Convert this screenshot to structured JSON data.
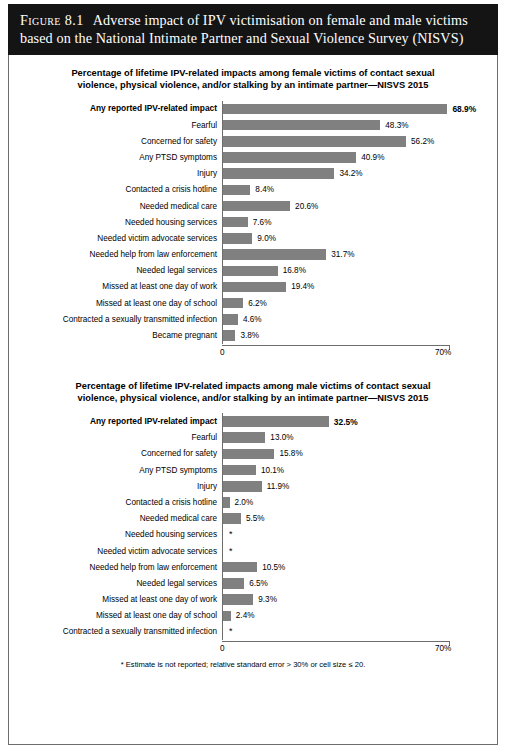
{
  "figure": {
    "label": "Figure 8.1",
    "title_line1": "Adverse impact of IPV victimisation on female and male victims",
    "title_line2": "based on the National Intimate Partner and Sexual Violence Survey (NISVS)"
  },
  "footnote": "* Estimate is not reported; relative standard error > 30% or cell size ≤ 20.",
  "axis": {
    "min_label": "0",
    "max_label": "70%"
  },
  "colors": {
    "bar": "#808080",
    "banner": "#141414",
    "frame": "#6d6d6d",
    "text": "#000000"
  },
  "chart_data": [
    {
      "type": "bar",
      "orientation": "horizontal",
      "title": "Percentage of lifetime IPV-related impacts among female victims of contact sexual violence, physical violence, and/or stalking by an intimate partner—NISVS 2015",
      "title_line1": "Percentage of lifetime IPV-related impacts among female victims of contact sexual",
      "title_line2": "violence, physical violence, and/or stalking by an intimate partner—NISVS 2015",
      "xlabel": "",
      "ylabel": "",
      "xlim": [
        0,
        70
      ],
      "grid": false,
      "legend": "none",
      "categories": [
        "Any reported IPV-related impact",
        "Fearful",
        "Concerned for safety",
        "Any PTSD symptoms",
        "Injury",
        "Contacted a crisis hotline",
        "Needed medical care",
        "Needed housing services",
        "Needed victim advocate services",
        "Needed help from law enforcement",
        "Needed legal services",
        "Missed at least one day of work",
        "Missed at least one day of school",
        "Contracted a sexually transmitted infection",
        "Became pregnant"
      ],
      "values": [
        68.9,
        48.3,
        56.2,
        40.9,
        34.2,
        8.4,
        20.6,
        7.6,
        9.0,
        31.7,
        16.8,
        19.4,
        6.2,
        4.6,
        3.8
      ],
      "value_labels": [
        "68.9%",
        "48.3%",
        "56.2%",
        "40.9%",
        "34.2%",
        "8.4%",
        "20.6%",
        "7.6%",
        "9.0%",
        "31.7%",
        "16.8%",
        "19.4%",
        "6.2%",
        "4.6%",
        "3.8%"
      ],
      "emphasis": [
        true,
        false,
        false,
        false,
        false,
        false,
        false,
        false,
        false,
        false,
        false,
        false,
        false,
        false,
        false
      ]
    },
    {
      "type": "bar",
      "orientation": "horizontal",
      "title": "Percentage of lifetime IPV-related impacts among male victims of contact sexual violence, physical violence, and/or stalking by an intimate partner—NISVS 2015",
      "title_line1": "Percentage of lifetime IPV-related impacts among male victims of contact sexual",
      "title_line2": "violence, physical violence, and/or stalking by an intimate partner—NISVS 2015",
      "xlabel": "",
      "ylabel": "",
      "xlim": [
        0,
        70
      ],
      "grid": false,
      "legend": "none",
      "categories": [
        "Any reported IPV-related impact",
        "Fearful",
        "Concerned for safety",
        "Any PTSD symptoms",
        "Injury",
        "Contacted a crisis hotline",
        "Needed medical care",
        "Needed housing services",
        "Needed victim advocate services",
        "Needed help from law enforcement",
        "Needed legal services",
        "Missed at least one day of work",
        "Missed at least one day of school",
        "Contracted a sexually transmitted infection"
      ],
      "values": [
        32.5,
        13.0,
        15.8,
        10.1,
        11.9,
        2.0,
        5.5,
        null,
        null,
        10.5,
        6.5,
        9.3,
        2.4,
        null
      ],
      "value_labels": [
        "32.5%",
        "13.0%",
        "15.8%",
        "10.1%",
        "11.9%",
        "2.0%",
        "5.5%",
        "*",
        "*",
        "10.5%",
        "6.5%",
        "9.3%",
        "2.4%",
        "*"
      ],
      "emphasis": [
        true,
        false,
        false,
        false,
        false,
        false,
        false,
        false,
        false,
        false,
        false,
        false,
        false,
        false
      ]
    }
  ]
}
